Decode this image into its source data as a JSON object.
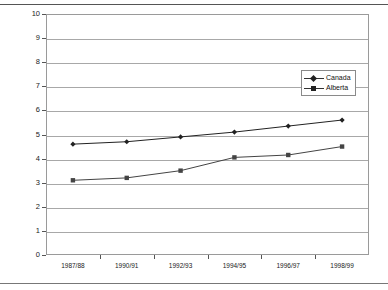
{
  "page": {
    "faint_header_text": "",
    "background": "#ffffff"
  },
  "chart_data": {
    "type": "line",
    "title": "",
    "xlabel": "",
    "ylabel": "Percentage of Total Enrollment",
    "ylim": [
      0,
      10
    ],
    "ytick_step": 1,
    "yticks": [
      "0",
      "1",
      "2",
      "3",
      "4",
      "5",
      "6",
      "7",
      "8",
      "9",
      "10"
    ],
    "categories": [
      "1987/88",
      "1990/91",
      "1992/93",
      "1994/95",
      "1996/97",
      "1998/99"
    ],
    "grid": "horizontal",
    "legend_position": "top-right-inside",
    "series": [
      {
        "name": "Canada",
        "marker": "diamond",
        "color": "#222222",
        "values": [
          4.6,
          4.7,
          4.9,
          5.1,
          5.35,
          5.6
        ]
      },
      {
        "name": "Alberta",
        "marker": "square",
        "color": "#444444",
        "values": [
          3.1,
          3.2,
          3.5,
          4.05,
          4.15,
          4.5
        ]
      }
    ]
  }
}
